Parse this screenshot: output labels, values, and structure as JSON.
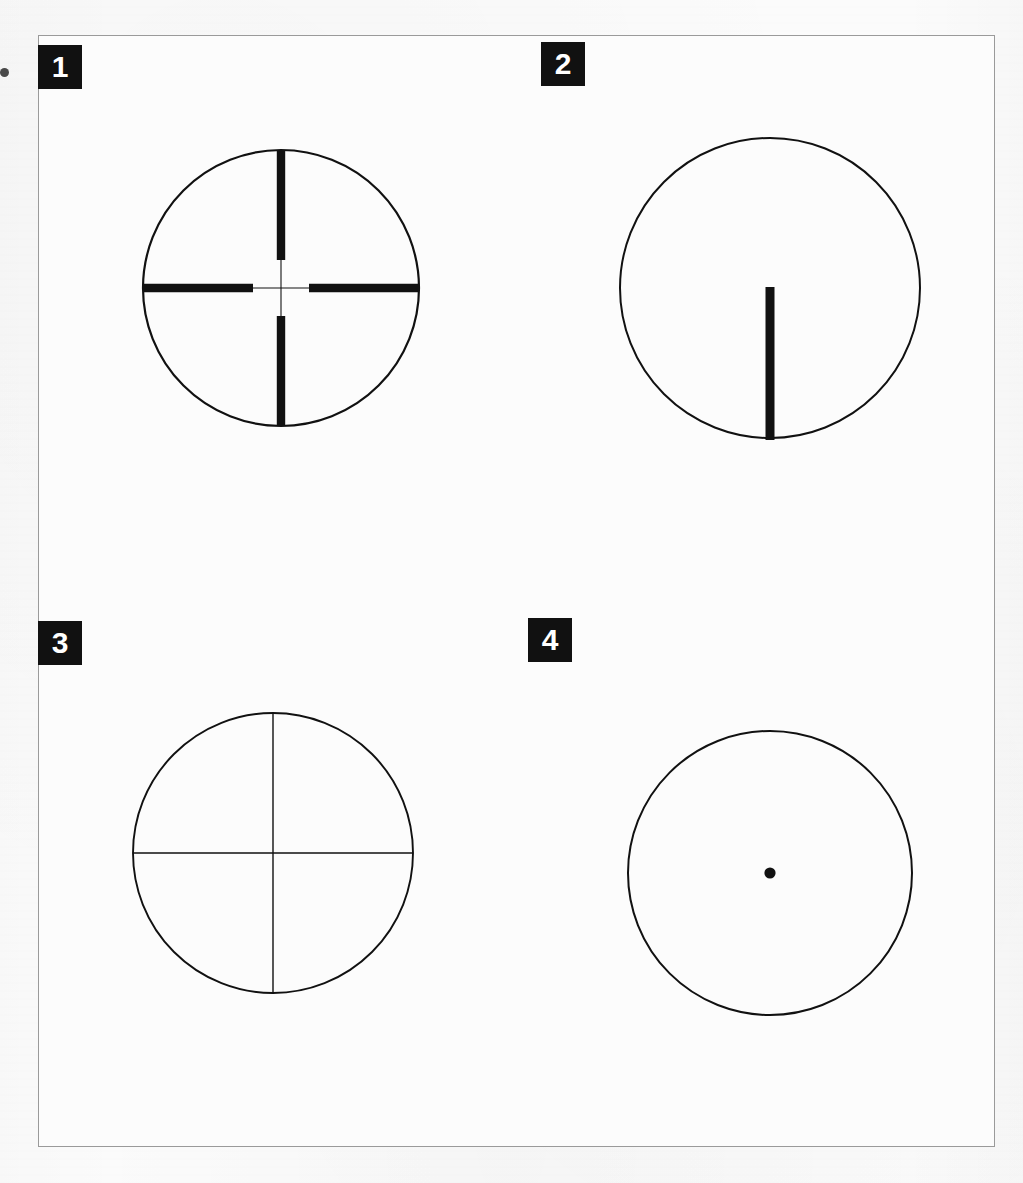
{
  "figure": {
    "background_color": "#fbfbfb",
    "border_color": "#9a9a9a",
    "ink_color": "#111111",
    "label_box_color": "#111111",
    "label_text_color": "#ffffff"
  },
  "panels": [
    {
      "label": "1",
      "reticle_name": "duplex-reticle",
      "description": "Duplex crosshair: heavy outer posts tapering to fine crosshairs at center",
      "label_x": 38,
      "label_y": 45,
      "circle": {
        "cx": 281,
        "cy": 288,
        "r": 138,
        "stroke_width": 2.2
      },
      "thick_post_width": 8.4,
      "thin_line_width": 1.1,
      "thick_post_inner_gap": 28
    },
    {
      "label": "2",
      "reticle_name": "post-reticle",
      "description": "Single heavy vertical post rising from bottom of field to center",
      "label_x": 541,
      "label_y": 42,
      "circle": {
        "cx": 770,
        "cy": 288,
        "r": 150,
        "stroke_width": 2.0
      },
      "post_width": 9.0,
      "post_top_y": 287,
      "post_bottom_y": 440
    },
    {
      "label": "3",
      "reticle_name": "fine-crosshair-reticle",
      "description": "Fine crosshair: uniformly thin lines spanning the full field",
      "label_x": 38,
      "label_y": 621,
      "circle": {
        "cx": 273,
        "cy": 853,
        "r": 140,
        "stroke_width": 1.9
      },
      "line_width": 1.4
    },
    {
      "label": "4",
      "reticle_name": "dot-reticle",
      "description": "Single aiming dot at the center of the field",
      "label_x": 528,
      "label_y": 618,
      "circle": {
        "cx": 770,
        "cy": 873,
        "r": 142,
        "stroke_width": 2.0
      },
      "dot": {
        "cx": 770,
        "cy": 873,
        "r": 5.6
      }
    }
  ]
}
